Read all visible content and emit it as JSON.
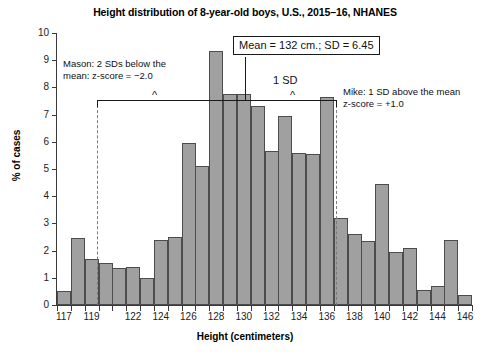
{
  "chart_data": {
    "type": "bar",
    "title": "Height distribution of 8-year-old boys, U.S., 2015–16, NHANES",
    "xlabel": "Height (centimeters)",
    "ylabel": "% of cases",
    "xlim": [
      117,
      147
    ],
    "ylim": [
      0,
      10
    ],
    "grid": false,
    "legend": "none",
    "y_ticks": [
      0,
      1,
      2,
      3,
      4,
      5,
      6,
      7,
      8,
      9,
      10
    ],
    "x_tick_labels": [
      "117",
      "119",
      "122",
      "124",
      "126",
      "128",
      "130",
      "132",
      "134",
      "136",
      "138",
      "140",
      "142",
      "144",
      "146"
    ],
    "x_tick_values": [
      117,
      119,
      122,
      124,
      126,
      128,
      130,
      132,
      134,
      136,
      138,
      140,
      142,
      144,
      146
    ],
    "categories": [
      117,
      118,
      119,
      120,
      121,
      122,
      123,
      124,
      125,
      126,
      127,
      128,
      129,
      130,
      131,
      132,
      133,
      134,
      135,
      136,
      137,
      138,
      139,
      140,
      141,
      142,
      143,
      144,
      145,
      146
    ],
    "values": [
      0.5,
      2.45,
      1.7,
      1.55,
      1.35,
      1.4,
      1.0,
      2.4,
      2.5,
      5.95,
      5.1,
      9.35,
      7.75,
      7.75,
      7.3,
      5.65,
      6.95,
      5.6,
      5.55,
      7.65,
      3.2,
      2.6,
      2.35,
      4.45,
      1.95,
      2.1,
      0.55,
      0.7,
      2.4,
      0.35
    ],
    "annotations": {
      "mean_box": "Mean = 132 cm.; SD = 6.45",
      "sd_label": "1 SD",
      "mason_line1": "Mason: 2 SDs below the",
      "mason_line2": "mean: z-score = −2.0",
      "mike_line1": "Mike: 1 SD above the mean",
      "mike_line2": "z-score = +1.0"
    }
  },
  "colors": {
    "bar_fill": "#a0a0a0",
    "bar_stroke": "#4c4c4c",
    "axis": "#3a3a3a",
    "annotation": "#1a1a1a",
    "dashed": "#7a7a7a",
    "background": "#ffffff"
  }
}
